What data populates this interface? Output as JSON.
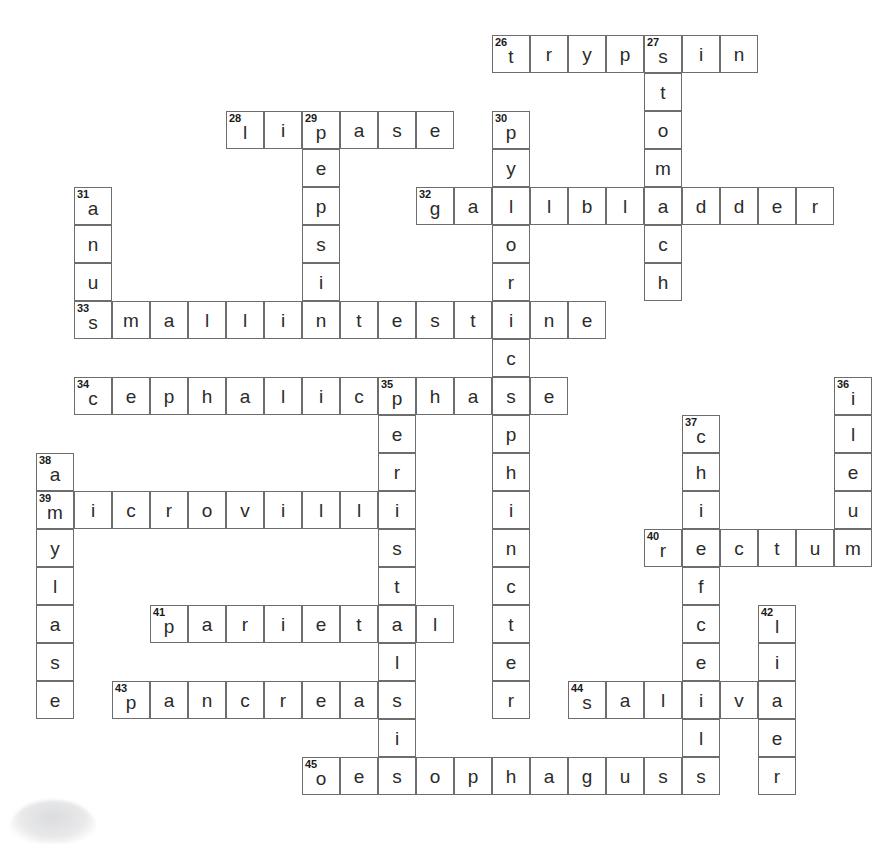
{
  "puzzle": {
    "title": "Digestive System Crossword",
    "grid": {
      "origin_x": 36,
      "origin_y": 35,
      "cell_size": 38,
      "cols": 22,
      "rows": 21
    },
    "entries": [
      {
        "number": "26",
        "answer": "trypsin",
        "direction": "across",
        "col": 12,
        "row": 0,
        "length": 7
      },
      {
        "number": "27",
        "answer": "stomach",
        "direction": "down",
        "col": 16,
        "row": 0,
        "length": 7
      },
      {
        "number": "28",
        "answer": "lipase",
        "direction": "across",
        "col": 5,
        "row": 2,
        "length": 6
      },
      {
        "number": "29",
        "answer": "pepsin",
        "direction": "down",
        "col": 7,
        "row": 2,
        "length": 6
      },
      {
        "number": "30",
        "answer": "pyloricsphincter",
        "direction": "down",
        "col": 12,
        "row": 2,
        "length": 16
      },
      {
        "number": "31",
        "answer": "anus",
        "direction": "down",
        "col": 1,
        "row": 4,
        "length": 4
      },
      {
        "number": "32",
        "answer": "gallbladder",
        "direction": "across",
        "col": 10,
        "row": 4,
        "length": 11
      },
      {
        "number": "33",
        "answer": "smallintestine",
        "direction": "across",
        "col": 1,
        "row": 7,
        "length": 14
      },
      {
        "number": "34",
        "answer": "cephalicphase",
        "direction": "across",
        "col": 1,
        "row": 9,
        "length": 13
      },
      {
        "number": "35",
        "answer": "peristalsis",
        "direction": "down",
        "col": 9,
        "row": 9,
        "length": 11
      },
      {
        "number": "36",
        "answer": "ileum",
        "direction": "down",
        "col": 21,
        "row": 9,
        "length": 5
      },
      {
        "number": "37",
        "answer": "chiefcells",
        "direction": "down",
        "col": 17,
        "row": 10,
        "length": 10
      },
      {
        "number": "38",
        "answer": "amylase",
        "direction": "down",
        "col": 0,
        "row": 11,
        "length": 7
      },
      {
        "number": "39",
        "answer": "microvilli",
        "direction": "across",
        "col": 0,
        "row": 12,
        "length": 10
      },
      {
        "number": "40",
        "answer": "rectum",
        "direction": "across",
        "col": 16,
        "row": 13,
        "length": 6
      },
      {
        "number": "41",
        "answer": "parietal",
        "direction": "across",
        "col": 3,
        "row": 15,
        "length": 8
      },
      {
        "number": "42",
        "answer": "liver",
        "direction": "down",
        "col": 19,
        "row": 15,
        "length": 5
      },
      {
        "number": "43",
        "answer": "pancreas",
        "direction": "across",
        "col": 2,
        "row": 17,
        "length": 8
      },
      {
        "number": "44",
        "answer": "saliva",
        "direction": "across",
        "col": 14,
        "row": 17,
        "length": 6
      },
      {
        "number": "45",
        "answer": "oesophagus",
        "direction": "across",
        "col": 7,
        "row": 19,
        "length": 10
      }
    ]
  },
  "colors": {
    "cell_border": "#6d6d6d",
    "cell_fill": "#ffffff",
    "letter": "#2b2b2b",
    "clue_number": "#1a1a1a",
    "page_background": "#ffffff"
  }
}
